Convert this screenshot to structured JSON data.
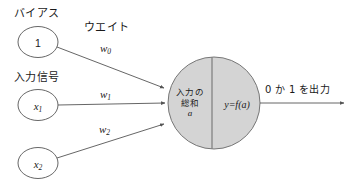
{
  "diagram": {
    "title_text": "",
    "colors": {
      "stroke": "#555555",
      "neuron_fill": "#d4d4d4",
      "text": "#1a1a1a",
      "background": "#ffffff"
    },
    "bias": {
      "caption": "バイアス",
      "node_value": "1",
      "weight_caption": "ウエイト",
      "weight_label": "w",
      "weight_sub": "0"
    },
    "inputs": {
      "caption": "入力信号",
      "nodes": [
        {
          "label": "x",
          "sub": "1",
          "weight_label": "w",
          "weight_sub": "1"
        },
        {
          "label": "x",
          "sub": "2",
          "weight_label": "w",
          "weight_sub": "2"
        }
      ]
    },
    "neuron": {
      "left_line1": "入力の",
      "left_line2": "総和",
      "left_line3": "a",
      "right_label": "y=f(a)"
    },
    "output": {
      "label": "0 か 1 を出力"
    }
  }
}
